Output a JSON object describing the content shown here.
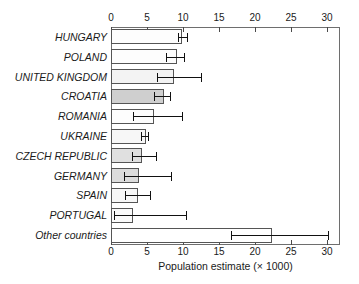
{
  "chart_data": {
    "type": "bar",
    "orientation": "horizontal",
    "title": "",
    "xlabel": "Population estimate (× 1000)",
    "ylabel": "",
    "xlim": [
      0,
      31.8
    ],
    "xticks": [
      0,
      5,
      10,
      15,
      20,
      25,
      30
    ],
    "xtick_labels": [
      "0",
      "5",
      "10",
      "15",
      "20",
      "25",
      "30"
    ],
    "grid": false,
    "legend": null,
    "axis_positions": [
      "top",
      "bottom"
    ],
    "categories": [
      "HUNGARY",
      "POLAND",
      "UNITED KINGDOM",
      "CROATIA",
      "ROMANIA",
      "UKRAINE",
      "CZECH REPUBLIC",
      "GERMANY",
      "SPAIN",
      "PORTUGAL",
      "Other countries"
    ],
    "values": [
      9.9,
      9.1,
      8.8,
      7.3,
      6.0,
      4.9,
      4.3,
      3.9,
      3.8,
      3.1,
      22.3
    ],
    "error_low": [
      9.3,
      7.6,
      6.4,
      6.0,
      3.1,
      4.2,
      2.9,
      1.8,
      2.0,
      0.4,
      16.7
    ],
    "error_high": [
      10.5,
      10.2,
      12.5,
      8.2,
      9.9,
      5.2,
      6.2,
      8.4,
      5.4,
      10.4,
      30.2
    ],
    "bar_fills": [
      "#fdfdfd",
      "#fdfdfd",
      "#f3f3f3",
      "#cfcfcf",
      "#fdfdfd",
      "#f7f7f7",
      "#e0e0e0",
      "#dcdcdc",
      "#f7f7f7",
      "#fafafa",
      "#ffffff"
    ],
    "bar_edge_color": "#555555",
    "error_color": "#111111",
    "frame_color": "#6e6e6e"
  }
}
